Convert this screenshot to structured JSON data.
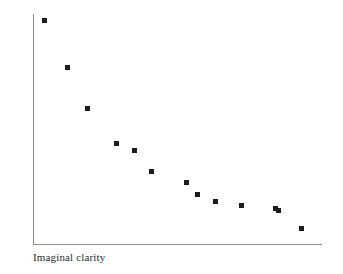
{
  "chart_data": {
    "type": "scatter",
    "title": "",
    "subtitle": "",
    "xlabel": "Imaginal clarity",
    "ylabel": "Anxiety",
    "grid": false,
    "legend": null,
    "tick_labels": {
      "x": [],
      "y": []
    },
    "axis_style": {
      "spines": [
        "left",
        "bottom"
      ],
      "ticks": "none",
      "color": "#8d8d8d"
    },
    "marker": {
      "shape": "square",
      "size_px": 5,
      "color": "#1c1c1c"
    },
    "xlim": [
      0,
      100
    ],
    "ylim": [
      0,
      100
    ],
    "points": [
      {
        "x": 4,
        "y": 97
      },
      {
        "x": 12,
        "y": 77
      },
      {
        "x": 19,
        "y": 59
      },
      {
        "x": 29,
        "y": 44
      },
      {
        "x": 35,
        "y": 41
      },
      {
        "x": 41,
        "y": 32
      },
      {
        "x": 53,
        "y": 27
      },
      {
        "x": 57,
        "y": 22
      },
      {
        "x": 63,
        "y": 19
      },
      {
        "x": 72,
        "y": 17
      },
      {
        "x": 84,
        "y": 16
      },
      {
        "x": 85,
        "y": 15
      },
      {
        "x": 93,
        "y": 7
      }
    ],
    "pixel_points": [
      {
        "px": 44,
        "py": 20
      },
      {
        "px": 68,
        "py": 67
      },
      {
        "px": 89,
        "py": 108
      },
      {
        "px": 100,
        "py": 145
      },
      {
        "px": 114,
        "py": 150
      },
      {
        "px": 128,
        "py": 172
      },
      {
        "px": 157,
        "py": 182
      },
      {
        "px": 199,
        "py": 196
      },
      {
        "px": 214,
        "py": 201
      },
      {
        "px": 243,
        "py": 205
      },
      {
        "px": 276,
        "py": 210
      },
      {
        "px": 299,
        "py": 228
      }
    ],
    "axes_geometry": {
      "x_axis_y_px": 245,
      "x_axis_x0_px": 33,
      "x_axis_x1_px": 322,
      "y_axis_x_px": 33,
      "y_axis_y0_px": 14,
      "y_axis_y1_px": 245
    },
    "colors": {
      "background": "#ffffff",
      "axis": "#8d8d8d",
      "marker": "#1c1c1c",
      "label_text": "#2b2b2b"
    }
  }
}
